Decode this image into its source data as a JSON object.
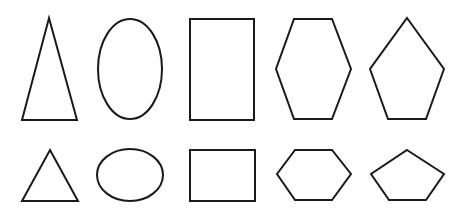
{
  "diagram": {
    "background": "#ffffff",
    "stroke_color": "#1a1a1a",
    "rows": [
      {
        "name": "tall-shapes",
        "shapes": [
          {
            "type": "triangle",
            "label": "tall isosceles triangle"
          },
          {
            "type": "ellipse",
            "label": "vertical ellipse"
          },
          {
            "type": "rectangle",
            "label": "tall rectangle"
          },
          {
            "type": "hexagon",
            "label": "tall hexagon"
          },
          {
            "type": "pentagon",
            "label": "tall pentagon"
          }
        ]
      },
      {
        "name": "short-shapes",
        "shapes": [
          {
            "type": "triangle",
            "label": "equilateral triangle"
          },
          {
            "type": "ellipse",
            "label": "horizontal ellipse"
          },
          {
            "type": "rectangle",
            "label": "wide rectangle"
          },
          {
            "type": "hexagon",
            "label": "wide hexagon"
          },
          {
            "type": "pentagon",
            "label": "wide pentagon"
          }
        ]
      }
    ]
  }
}
